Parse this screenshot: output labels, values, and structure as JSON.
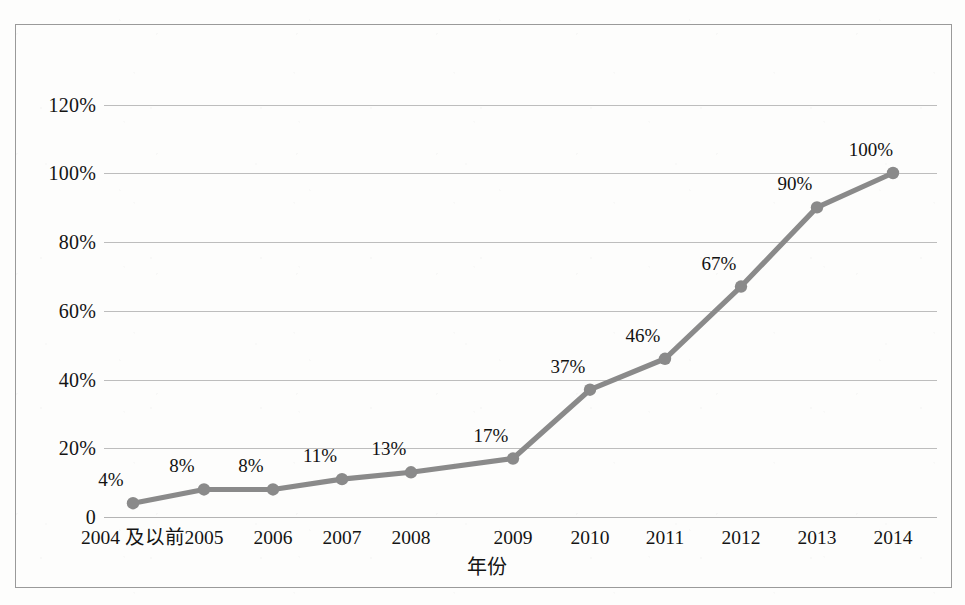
{
  "chart_data": {
    "type": "line",
    "title": "",
    "subtitle": "",
    "xlabel": "年份",
    "ylabel": "",
    "categories": [
      "2004 及以前",
      "2005",
      "2006",
      "2007",
      "2008",
      "2009",
      "2010",
      "2011",
      "2012",
      "2013",
      "2014"
    ],
    "values": [
      4,
      8,
      8,
      11,
      13,
      17,
      37,
      46,
      67,
      90,
      100
    ],
    "point_labels": [
      "4%",
      "8%",
      "8%",
      "11%",
      "13%",
      "17%",
      "37%",
      "46%",
      "67%",
      "90%",
      "100%"
    ],
    "ylim": [
      0,
      120
    ],
    "yticks": [
      0,
      20,
      40,
      60,
      80,
      100,
      120
    ],
    "ytick_labels": [
      "0",
      "20%",
      "40%",
      "60%",
      "80%",
      "100%",
      "120%"
    ],
    "grid": true,
    "legend": "none",
    "series_color": "#8a8a8a",
    "marker": "circle",
    "data_label_position": "above-left",
    "series": [
      {
        "name": "累计百分比",
        "values": [
          4,
          8,
          8,
          11,
          13,
          17,
          37,
          46,
          67,
          90,
          100
        ]
      }
    ]
  },
  "style": {
    "frame_color": "#9a9a9a",
    "gridline_color": "#bdbdbd",
    "text_color": "#141414",
    "background_color": "#fdfdfc",
    "line_color": "#8a8a8a"
  }
}
